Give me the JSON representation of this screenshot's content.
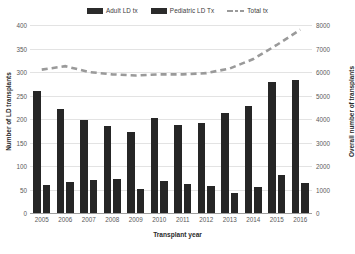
{
  "chart_data": {
    "type": "bar",
    "title": "",
    "subtitle": "",
    "xlabel": "Transplant year",
    "ylabel": "Number of LD transplants",
    "ylabel_secondary": "Overall number of transplants",
    "categories": [
      "2005",
      "2006",
      "2007",
      "2008",
      "2009",
      "2010",
      "2011",
      "2012",
      "2013",
      "2014",
      "2015",
      "2016"
    ],
    "ylim": [
      0,
      400
    ],
    "ylim_secondary": [
      0,
      8000
    ],
    "yticks": [
      0,
      50,
      100,
      150,
      200,
      250,
      300,
      350,
      400
    ],
    "yticks_secondary": [
      0,
      1000,
      2000,
      3000,
      4000,
      5000,
      6000,
      7000,
      8000
    ],
    "grid": true,
    "legend_position": "top",
    "series": [
      {
        "name": "Adult LD tx",
        "type": "bar",
        "axis": "left",
        "color": "#262626",
        "values": [
          260,
          222,
          197,
          185,
          172,
          202,
          188,
          192,
          212,
          228,
          278,
          282
        ]
      },
      {
        "name": "Pediatric LD Tx",
        "type": "bar",
        "axis": "left",
        "color": "#262626",
        "values": [
          60,
          65,
          70,
          72,
          52,
          68,
          62,
          58,
          42,
          55,
          80,
          63
        ]
      },
      {
        "name": "Total tx",
        "type": "line",
        "axis": "right",
        "color": "#9a9a9a",
        "style": "dashed",
        "values": [
          6100,
          6250,
          6000,
          5900,
          5850,
          5900,
          5900,
          5950,
          6150,
          6550,
          7150,
          7800
        ]
      }
    ]
  },
  "legend": {
    "items": [
      {
        "label": "Adult LD tx",
        "marker": "bar-swatch-icon"
      },
      {
        "label": "Pediatric LD Tx",
        "marker": "bar-swatch-icon"
      },
      {
        "label": "Total tx",
        "marker": "dashed-line-icon"
      }
    ]
  },
  "axes": {
    "left": {
      "title": "Number of LD transplants",
      "ticks": [
        "400",
        "350",
        "300",
        "250",
        "200",
        "150",
        "100",
        "50",
        "0"
      ]
    },
    "right": {
      "title": "Overall number of transplants",
      "ticks": [
        "8000",
        "7000",
        "6000",
        "5000",
        "4000",
        "3000",
        "2000",
        "1000",
        "0"
      ]
    },
    "bottom": {
      "title": "Transplant year",
      "ticks": [
        "2005",
        "2006",
        "2007",
        "2008",
        "2009",
        "2010",
        "2011",
        "2012",
        "2013",
        "2014",
        "2015",
        "2016"
      ]
    }
  }
}
